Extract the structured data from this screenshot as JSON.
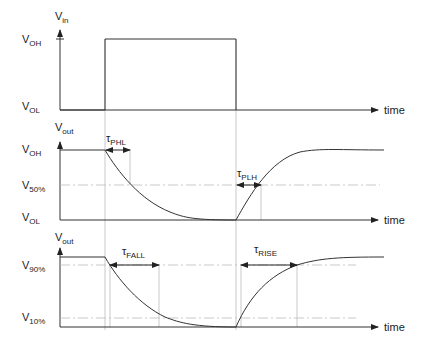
{
  "diagram": {
    "panels": [
      {
        "id": "input",
        "y_axis_label": "V",
        "y_axis_sub": "in",
        "levels": [
          {
            "label": "V",
            "sub": "OH"
          },
          {
            "label": "V",
            "sub": "OL"
          }
        ],
        "x_axis_label": "time"
      },
      {
        "id": "output-delay",
        "y_axis_label": "V",
        "y_axis_sub": "out",
        "levels": [
          {
            "label": "V",
            "sub": "OH"
          },
          {
            "label": "V",
            "sub": "50%"
          },
          {
            "label": "V",
            "sub": "OL"
          }
        ],
        "markers": [
          {
            "label": "τ",
            "sub": "PHL"
          },
          {
            "label": "τ",
            "sub": "PLH"
          }
        ],
        "x_axis_label": "time"
      },
      {
        "id": "output-transition",
        "y_axis_label": "V",
        "y_axis_sub": "out",
        "levels": [
          {
            "label": "V",
            "sub": "90%"
          },
          {
            "label": "V",
            "sub": "10%"
          }
        ],
        "markers": [
          {
            "label": "τ",
            "sub": "FALL"
          },
          {
            "label": "τ",
            "sub": "RISE"
          }
        ],
        "x_axis_label": "time"
      }
    ]
  },
  "colors": {
    "line": "#333333",
    "guide": "#aaaaaa",
    "text": "#222222"
  }
}
